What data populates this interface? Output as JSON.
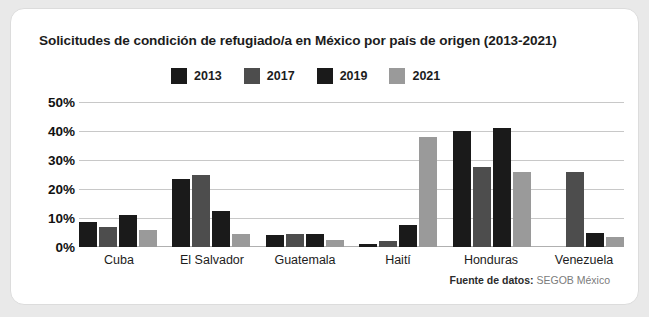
{
  "card": {
    "title": "Solicitudes de condición de refugiado/a en México por país de origen (2013-2021)",
    "source_prefix": "Fuente de datos:",
    "source_value": " SEGOB México"
  },
  "colors": {
    "series_2013": "#1a1a1a",
    "series_2017": "#4d4d4d",
    "series_2019": "#1a1a1a",
    "series_2021": "#9a9a9a",
    "gridline": "#c8c8c8",
    "card_background": "#ffffff",
    "page_background": "#e9e9e9",
    "text": "#1c1c1c",
    "source_text": "#7b7b7b"
  },
  "chart_data": {
    "type": "bar",
    "title": "Solicitudes de condición de refugiado/a en México por país de origen (2013-2021)",
    "xlabel": "",
    "ylabel": "",
    "ylim": [
      0,
      50
    ],
    "ytick_labels": [
      "50%",
      "40%",
      "30%",
      "20%",
      "10%",
      "0%"
    ],
    "ytick_values": [
      50,
      40,
      30,
      20,
      10,
      0
    ],
    "grid": true,
    "legend_position": "top",
    "categories": [
      "Cuba",
      "El Salvador",
      "Guatemala",
      "Haití",
      "Honduras",
      "Venezuela"
    ],
    "series": [
      {
        "name": "2013",
        "color": "#1a1a1a",
        "values": [
          8.5,
          23.5,
          4,
          1,
          40,
          0
        ]
      },
      {
        "name": "2017",
        "color": "#4d4d4d",
        "values": [
          7,
          25,
          4.5,
          2,
          27.5,
          26
        ]
      },
      {
        "name": "2019",
        "color": "#1a1a1a",
        "values": [
          11,
          12.5,
          4.5,
          7.5,
          41,
          5
        ]
      },
      {
        "name": "2021",
        "color": "#9a9a9a",
        "values": [
          6,
          4.5,
          2.5,
          38,
          26,
          3.5
        ]
      }
    ]
  }
}
